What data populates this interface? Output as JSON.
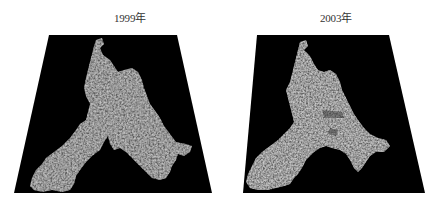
{
  "panels": [
    {
      "title": "1999年",
      "trapezoid": {
        "top_left": [
          49,
          35
        ],
        "top_right": [
          177,
          35
        ],
        "bottom_right": [
          212,
          193
        ],
        "bottom_left": [
          14,
          193
        ]
      },
      "background_color": "#000000",
      "region_shape": "Y-shaped city area with west arm, north lobe and south-east extension"
    },
    {
      "title": "2003年",
      "trapezoid": {
        "top_left": [
          257,
          35
        ],
        "top_right": [
          389,
          35
        ],
        "bottom_right": [
          425,
          193
        ],
        "bottom_left": [
          243,
          193
        ]
      },
      "background_color": "#000000",
      "region_shape": "Expanded urban area with north lobe, west arm and south-east extension"
    }
  ],
  "colors": {
    "page_background": "#ffffff",
    "map_background": "#000000",
    "urban_texture_light": "#bdbdbd",
    "urban_texture_mid": "#7a7a7a",
    "urban_texture_dark": "#4a4a4a"
  }
}
